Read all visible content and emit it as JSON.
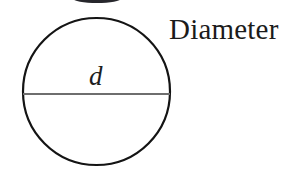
{
  "figure": {
    "type": "geometry-diagram",
    "background_color": "#ffffff",
    "circle": {
      "center_x": 96.5,
      "center_y": 91.5,
      "radius": 73.5,
      "stroke_color": "#141414",
      "stroke_width": 2.2,
      "fill": "none"
    },
    "diameter_line": {
      "x1": 23,
      "y1": 94,
      "x2": 170,
      "y2": 94,
      "stroke_color": "#6e6e6e",
      "stroke_width": 2,
      "length_px": 147
    },
    "top_crop_artifact": {
      "shape": "ellipse-fragment",
      "center_x": 97,
      "color": "#15151a"
    }
  },
  "labels": {
    "diameter_text": "Diameter",
    "diameter_symbol": "d"
  }
}
